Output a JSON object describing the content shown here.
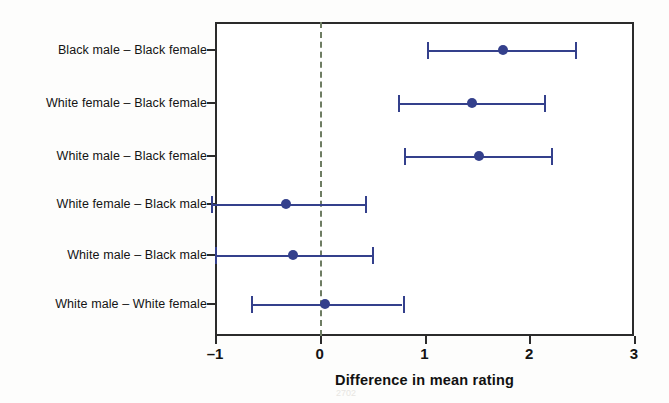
{
  "chart_data": {
    "type": "scatter",
    "title": "",
    "xlabel": "Difference in mean rating",
    "ylabel": "",
    "xlim": [
      -1,
      3
    ],
    "xticks": [
      -1,
      0,
      1,
      2,
      3
    ],
    "xticklabels": [
      "–1",
      "0",
      "1",
      "2",
      "3"
    ],
    "grid": false,
    "legend": null,
    "reference_line": {
      "value": 0,
      "style": "dashed",
      "color": "#6e7d63"
    },
    "series_color": "#34408c",
    "categories": [
      "Black male – Black female",
      "White female – Black female",
      "White male – Black female",
      "White female – Black male",
      "White male – Black male",
      "White male – White female"
    ],
    "points": [
      {
        "label": "Black male – Black female",
        "estimate": 1.75,
        "ci_low": 1.02,
        "ci_high": 2.44
      },
      {
        "label": "White female – Black female",
        "estimate": 1.45,
        "ci_low": 0.75,
        "ci_high": 2.14
      },
      {
        "label": "White male – Black female",
        "estimate": 1.52,
        "ci_low": 0.8,
        "ci_high": 2.21
      },
      {
        "label": "White female – Black male",
        "estimate": -0.32,
        "ci_low": -1.04,
        "ci_high": 0.43
      },
      {
        "label": "White male – Black male",
        "estimate": -0.26,
        "ci_low": -1.0,
        "ci_high": 0.5
      },
      {
        "label": "White male – White female",
        "estimate": 0.05,
        "ci_low": -0.66,
        "ci_high": 0.79
      }
    ]
  },
  "axis": {
    "x_title": "Difference in mean rating"
  }
}
